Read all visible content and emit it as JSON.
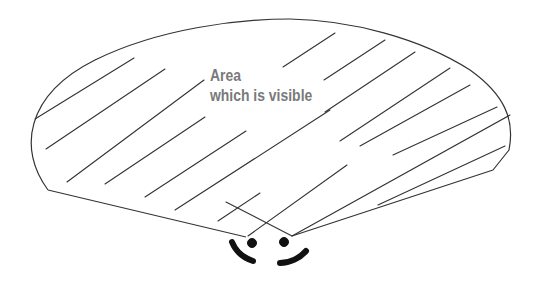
{
  "diagram": {
    "label": {
      "line1": "Area",
      "line2": "which is visible"
    },
    "colors": {
      "outline": "#333333",
      "hatch": "#333333",
      "label": "#7a7a7a",
      "face": "#111111",
      "background": "#ffffff"
    }
  }
}
